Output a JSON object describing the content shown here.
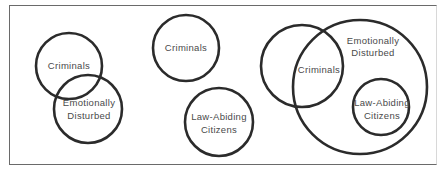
{
  "figure": {
    "panels": [
      {
        "id": "panel-1",
        "circles": [
          {
            "label_lines": [
              "Criminals"
            ]
          },
          {
            "label_lines": [
              "Emotionally",
              "Disturbed"
            ]
          }
        ]
      },
      {
        "id": "panel-2",
        "circles": [
          {
            "label_lines": [
              "Criminals"
            ]
          },
          {
            "label_lines": [
              "Law-Abiding",
              "Citizens"
            ]
          }
        ]
      },
      {
        "id": "panel-3",
        "circles": [
          {
            "label_lines": [
              "Criminals"
            ]
          },
          {
            "label_lines": [
              "Emotionally",
              "Disturbed"
            ]
          },
          {
            "label_lines": [
              "Law-Abiding",
              "Citizens"
            ]
          }
        ]
      }
    ],
    "colors": {
      "stroke": "#2b2b2b",
      "text": "#4a4a4a",
      "frame": "#6a6a6a"
    }
  }
}
